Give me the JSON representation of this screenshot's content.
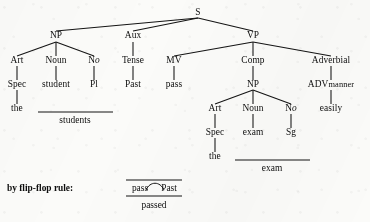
{
  "diagram": {
    "kind": "syntactic-tree-diagram",
    "ink_color": "#141414",
    "paper_color": "#fbfbf9",
    "sentence": "the students passed the exam easily"
  },
  "nodes": {
    "s": "S",
    "np_subject": "NP",
    "aux": "Aux",
    "vp": "VP",
    "art_1": "Art",
    "noun_1": "Noun",
    "no_1_main": "N",
    "no_1_sub": "o",
    "tense": "Tense",
    "mv": "MV",
    "comp": "Comp",
    "adverbial": "Adverbial",
    "spec_1": "Spec",
    "student": "student",
    "pl": "Pl",
    "past": "Past",
    "pass": "pass",
    "np_object": "NP",
    "adv_main": "ADV",
    "adv_sub": "manner",
    "the_1": "the",
    "students": "students",
    "art_2": "Art",
    "noun_2": "Noun",
    "no_2_main": "N",
    "no_2_sub": "o",
    "easily": "easily",
    "spec_2": "Spec",
    "exam_terminal": "exam",
    "sg": "Sg",
    "the_2": "the",
    "exam_result": "exam"
  },
  "flip_flop": {
    "caption": "by flip-flop rule:",
    "left_word": "pass",
    "right_word": "Past",
    "result": "passed"
  }
}
